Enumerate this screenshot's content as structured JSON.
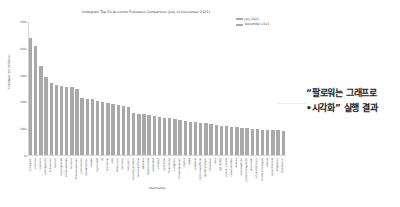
{
  "chart_data": {
    "type": "bar",
    "title": "Instagram Top 50 Accounts Followers Comparison (July vs December 2021)",
    "xlabel": "Username",
    "ylabel": "Followers (in Millions)",
    "ylim": [
      0,
      500
    ],
    "grid": false,
    "legend_position": "upper right",
    "yticks": [
      "0",
      "100",
      "200",
      "300",
      "400",
      "500"
    ],
    "legend": [
      "July 2021",
      "December 2021"
    ],
    "series": [
      {
        "name": "July 2021",
        "color": "#a9a9a9",
        "values": [
          440,
          410,
          335,
          295,
          270,
          265,
          262,
          258,
          255,
          250,
          215,
          212,
          210,
          205,
          200,
          196,
          192,
          188,
          185,
          182,
          160,
          156,
          154,
          150,
          148,
          145,
          142,
          140,
          136,
          133,
          130,
          127,
          124,
          122,
          120,
          117,
          114,
          112,
          110,
          108,
          106,
          104,
          102,
          100,
          99,
          97,
          96,
          95,
          94,
          93
        ]
      }
    ],
    "categories": [
      "instagram",
      "cristiano",
      "leomessi",
      "selenagomez",
      "kyliejenner",
      "therock",
      "arianagrande",
      "kimkardashian",
      "beyonce",
      "khloekardashian",
      "justinbieber",
      "kendalljenner",
      "natgeo",
      "taylorswift",
      "jlo",
      "nickiminaj",
      "nike",
      "mileycyrus",
      "neymarjr",
      "katyperry",
      "kourtneykardash",
      "kevinhart4real",
      "ddlovato",
      "theellenshow",
      "realmadrid",
      "zendaya",
      "virat.kohli",
      "fcbarcelona",
      "badgalriri",
      "champagnepapi",
      "shakira",
      "9gag",
      "vindiesel",
      "chrisbrownofficial",
      "davidbeckham",
      "billieeilish",
      "nasa",
      "gal_gadot",
      "camila_cabello",
      "shawnmendes",
      "dualipa",
      "emmawatson",
      "jamesrodriguez10",
      "iamcardib",
      "priyankachopra",
      "championsleague",
      "marvel",
      "narendramodi",
      "kingjames",
      "lalalalisa_m"
    ]
  },
  "annotation": {
    "line1": "“팔로워는 그래프로",
    "line2": "•시각화” 실행 결과"
  },
  "colors": {
    "bar": "#a9a9a9",
    "background": "#ffffff",
    "axis": "#d6d6d6",
    "text": "#4a4a4a"
  }
}
